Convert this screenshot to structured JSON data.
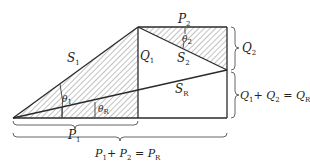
{
  "diagram": {
    "labels": {
      "S1": "S",
      "S1_sub": "1",
      "S2": "S",
      "S2_sub": "2",
      "SR": "S",
      "SR_sub": "R",
      "Q1": "Q",
      "Q1_sub": "1",
      "P2": "P",
      "P2_sub": "2",
      "theta1": "θ",
      "theta1_sub": "1",
      "theta2": "θ",
      "theta2_sub": "2",
      "thetaR": "θ",
      "thetaR_sub": "R",
      "P1": "P",
      "P1_sub": "1",
      "Q2": "Q",
      "Q2_sub": "2",
      "Qsum_a": "Q",
      "Qsum_a_sub": "1",
      "Qsum_plus": "+ ",
      "Qsum_b": "Q",
      "Qsum_b_sub": "2",
      "Qsum_eq": " = ",
      "Qsum_c": "Q",
      "Qsum_c_sub": "R",
      "Psum_a": "P",
      "Psum_a_sub": "1",
      "Psum_plus": "+ ",
      "Psum_b": "P",
      "Psum_b_sub": "2",
      "Psum_eq": " = ",
      "Psum_c": "P",
      "Psum_c_sub": "R"
    },
    "colors": {
      "line": "#2a2a2a",
      "hatch": "#555555",
      "text": "#222222"
    }
  }
}
